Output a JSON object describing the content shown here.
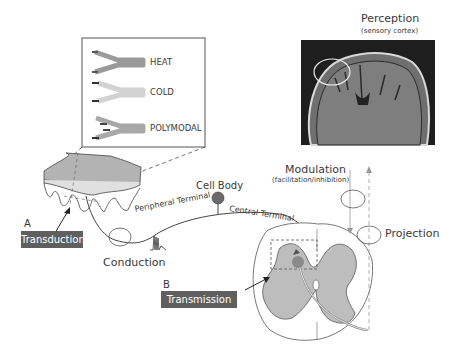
{
  "receptor_legend": {
    "items": [
      {
        "label": "HEAT",
        "color": "#9a9a9a"
      },
      {
        "label": "COLD",
        "color": "#d2d2d2"
      },
      {
        "label": "POLYMODAL",
        "color": "#a8a8a8"
      }
    ]
  },
  "perception": {
    "title": "Perception",
    "subtitle": "(sensory cortex)"
  },
  "modulation": {
    "title": "Modulation",
    "subtitle": "(facilitation/inhibition)"
  },
  "projection": {
    "label": "Projection"
  },
  "neuron": {
    "cell_body": "Cell Body",
    "peripheral_terminal": "Peripheral Terminal",
    "central_terminal": "Central Terminal"
  },
  "conduction": {
    "label": "Conduction"
  },
  "transduction": {
    "letter": "A",
    "label": "Transduction"
  },
  "transmission": {
    "letter": "B",
    "label": "Transmission"
  },
  "colors": {
    "box_fill": "#5f5f5f",
    "gray_matter": "#bdbdbd",
    "outline": "#444444",
    "accent_dot": "#8a8a8a"
  }
}
